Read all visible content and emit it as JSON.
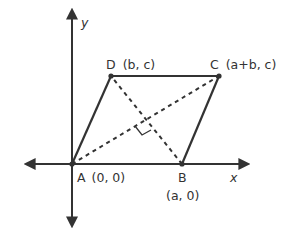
{
  "diagram": {
    "type": "coordinate-geometry-parallelogram",
    "axes": {
      "x_label": "x",
      "y_label": "y"
    },
    "vertices": [
      {
        "name": "A",
        "coords": "(0, 0)"
      },
      {
        "name": "B",
        "coords": "(a, 0)"
      },
      {
        "name": "C",
        "coords": "(a+b, c)"
      },
      {
        "name": "D",
        "coords": "(b, c)"
      }
    ],
    "labels": {
      "A": "A",
      "A_coords": "(0, 0)",
      "B": "B",
      "B_coords": "(a, 0)",
      "C": "C",
      "C_coords": "(a+b, c)",
      "D": "D",
      "D_coords": "(b, c)"
    },
    "diagonals": [
      "AC",
      "BD"
    ],
    "annotations": [
      "right angle at intersection of diagonals"
    ],
    "colors": {
      "line": "#333333",
      "background": "#ffffff"
    }
  }
}
